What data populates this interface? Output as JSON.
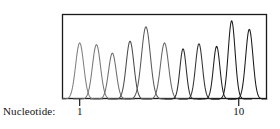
{
  "figure": {
    "axis_caption": "Nucleotide:",
    "box": {
      "x": 62,
      "y": 14,
      "width": 205,
      "height": 85
    },
    "frame_color": "#1a1a1a",
    "frame_width": 1.3,
    "background": "#ffffff"
  },
  "chart_data": {
    "type": "line",
    "title": "",
    "xlabel": "Nucleotide:",
    "ylabel": "",
    "grid": false,
    "legend": null,
    "xlim": [
      0,
      11.6
    ],
    "ylim": [
      0,
      1.0
    ],
    "x_ticks": [
      1,
      10
    ],
    "x_tick_labels": [
      "1",
      "10"
    ],
    "y_ticks": [],
    "y_tick_labels": [],
    "series": [
      {
        "name": "peak-1",
        "center": 1.0,
        "height": 0.66,
        "width": 0.42,
        "color": "#808080"
      },
      {
        "name": "peak-2",
        "center": 1.95,
        "height": 0.64,
        "width": 0.42,
        "color": "#787878"
      },
      {
        "name": "peak-3",
        "center": 2.85,
        "height": 0.54,
        "width": 0.4,
        "color": "#6e6e6e"
      },
      {
        "name": "peak-4",
        "center": 3.85,
        "height": 0.68,
        "width": 0.4,
        "color": "#4a4a4a"
      },
      {
        "name": "peak-5",
        "center": 4.75,
        "height": 0.85,
        "width": 0.46,
        "color": "#5a5a5a"
      },
      {
        "name": "peak-6",
        "center": 5.8,
        "height": 0.66,
        "width": 0.42,
        "color": "#666666"
      },
      {
        "name": "peak-7",
        "center": 6.85,
        "height": 0.59,
        "width": 0.33,
        "color": "#2e2e2e"
      },
      {
        "name": "peak-8",
        "center": 7.75,
        "height": 0.65,
        "width": 0.36,
        "color": "#333333"
      },
      {
        "name": "peak-9",
        "center": 8.75,
        "height": 0.62,
        "width": 0.34,
        "color": "#1f1f1f"
      },
      {
        "name": "peak-10",
        "center": 9.6,
        "height": 0.92,
        "width": 0.36,
        "color": "#1a1a1a"
      },
      {
        "name": "peak-11",
        "center": 10.6,
        "height": 0.82,
        "width": 0.38,
        "color": "#1a1a1a"
      }
    ]
  }
}
